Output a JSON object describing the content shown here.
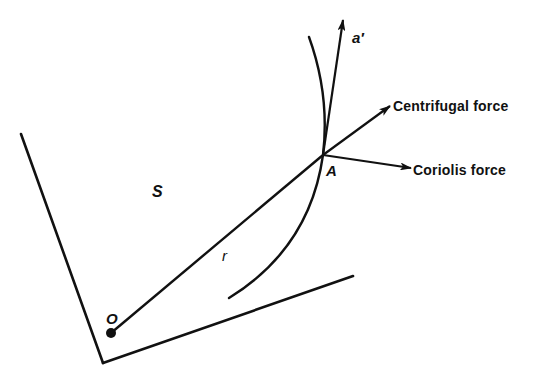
{
  "diagram": {
    "labels": {
      "accel": "a′",
      "centrifugal": "Centrifugal force",
      "coriolis": "Coriolis force",
      "point_a": "A",
      "frame": "S",
      "radius": "r",
      "origin": "O"
    },
    "colors": {
      "ink": "#111111",
      "background": "#ffffff"
    }
  }
}
